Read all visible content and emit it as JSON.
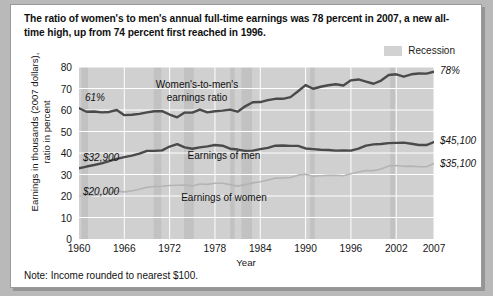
{
  "title": "The ratio of women's to men's annual full-time earnings was 78 percent in 2007, a new all-time high, up from 74 percent first reached in 1996.",
  "legend": {
    "recession_label": "Recession",
    "recession_color": "#d2d2d2"
  },
  "note": "Note: Income rounded to nearest $100.",
  "annotations": {
    "ratio_start": "61%",
    "ratio_end": "78%",
    "men_start": "$32,900",
    "men_end": "$45,100",
    "women_start": "$20,000",
    "women_end": "$35,100",
    "ratio_series_label_line1": "Women's-to-men's",
    "ratio_series_label_line2": "earnings ratio",
    "men_series_label": "Earnings of men",
    "women_series_label": "Earnings of women"
  },
  "chart_data": {
    "type": "line",
    "title": "The ratio of women's to men's annual full-time earnings was 78 percent in 2007, a new all-time high, up from 74 percent first reached in 1996.",
    "xlabel": "Year",
    "ylabel": "Earnings in thousands (2007 dollars), ratio in percent",
    "ylabel_line1": "Earnings in thousands (2007 dollars),",
    "ylabel_line2": "ratio in percent",
    "xlim": [
      1960,
      2007
    ],
    "ylim": [
      0,
      80
    ],
    "yticks": [
      0,
      10,
      20,
      30,
      40,
      50,
      60,
      70,
      80
    ],
    "xticks": [
      1960,
      1966,
      1972,
      1978,
      1984,
      1990,
      1996,
      2002,
      2007
    ],
    "grid": true,
    "legend_position": "top-right",
    "x": [
      1960,
      1961,
      1962,
      1963,
      1964,
      1965,
      1966,
      1967,
      1968,
      1969,
      1970,
      1971,
      1972,
      1973,
      1974,
      1975,
      1976,
      1977,
      1978,
      1979,
      1980,
      1981,
      1982,
      1983,
      1984,
      1985,
      1986,
      1987,
      1988,
      1989,
      1990,
      1991,
      1992,
      1993,
      1994,
      1995,
      1996,
      1997,
      1998,
      1999,
      2000,
      2001,
      2002,
      2003,
      2004,
      2005,
      2006,
      2007
    ],
    "series": [
      {
        "name": "Women's-to-men's earnings ratio",
        "units": "percent",
        "color": "#4a4a4a",
        "values": [
          60.8,
          59.2,
          59.3,
          58.9,
          59.1,
          60.0,
          57.6,
          57.8,
          58.2,
          58.9,
          59.4,
          59.5,
          57.9,
          56.6,
          58.8,
          58.8,
          60.2,
          58.9,
          59.4,
          59.7,
          60.2,
          59.2,
          61.7,
          63.6,
          63.7,
          64.6,
          65.2,
          65.2,
          66.0,
          68.7,
          71.6,
          69.9,
          70.8,
          71.5,
          72.0,
          71.4,
          73.8,
          74.2,
          73.2,
          72.2,
          73.7,
          76.3,
          76.6,
          75.5,
          76.6,
          77.0,
          76.9,
          77.8
        ]
      },
      {
        "name": "Earnings of men",
        "units": "thousands of 2007 dollars",
        "color": "#4a4a4a",
        "values": [
          32.9,
          33.7,
          34.4,
          35.2,
          36.2,
          37.3,
          38.1,
          38.8,
          39.7,
          41.0,
          41.0,
          41.2,
          43.0,
          44.1,
          42.6,
          42.0,
          42.6,
          43.1,
          43.7,
          43.4,
          42.0,
          41.6,
          41.0,
          41.1,
          41.8,
          42.4,
          43.4,
          43.5,
          43.3,
          43.3,
          42.1,
          41.8,
          41.5,
          41.4,
          41.1,
          41.2,
          41.1,
          42.0,
          43.4,
          44.0,
          44.2,
          44.6,
          44.7,
          44.8,
          44.3,
          43.7,
          43.7,
          45.1
        ]
      },
      {
        "name": "Earnings of women",
        "units": "thousands of 2007 dollars",
        "color": "#b4b4b4",
        "values": [
          20.0,
          20.0,
          20.4,
          20.7,
          21.4,
          22.4,
          21.9,
          22.4,
          23.1,
          24.1,
          24.4,
          24.5,
          24.9,
          25.0,
          25.1,
          24.7,
          25.6,
          25.4,
          25.9,
          25.9,
          25.3,
          24.6,
          25.3,
          26.1,
          26.6,
          27.4,
          28.3,
          28.4,
          28.6,
          29.7,
          30.1,
          29.2,
          29.4,
          29.6,
          29.6,
          29.4,
          30.3,
          31.2,
          31.8,
          31.8,
          32.6,
          34.0,
          34.2,
          33.8,
          33.9,
          33.6,
          33.6,
          35.1
        ]
      }
    ],
    "recessions": [
      {
        "start": 1960.3,
        "end": 1961.2
      },
      {
        "start": 1969.9,
        "end": 1970.9
      },
      {
        "start": 1973.9,
        "end": 1975.2
      },
      {
        "start": 1980.0,
        "end": 1980.6
      },
      {
        "start": 1981.5,
        "end": 1982.9
      },
      {
        "start": 1990.6,
        "end": 1991.2
      },
      {
        "start": 2001.2,
        "end": 2001.9
      }
    ]
  }
}
